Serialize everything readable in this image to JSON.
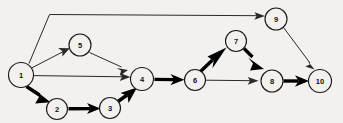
{
  "diagram": {
    "background_color": "#f2f1ef",
    "node_fill": "#f2f1ef",
    "node_stroke": "#1a1a1a",
    "edge_thin_color": "#2a2a2a",
    "edge_bold_color": "#000000",
    "nodes": [
      {
        "id": "1",
        "label": "1",
        "cx": 21,
        "cy": 75,
        "r": 12.5
      },
      {
        "id": "2",
        "label": "2",
        "cx": 57,
        "cy": 109,
        "r": 10.5
      },
      {
        "id": "3",
        "label": "3",
        "cx": 110,
        "cy": 108,
        "r": 10.5
      },
      {
        "id": "4",
        "label": "4",
        "cx": 142,
        "cy": 79,
        "r": 11.5
      },
      {
        "id": "5",
        "label": "5",
        "cx": 80,
        "cy": 45,
        "r": 11.0
      },
      {
        "id": "6",
        "label": "6",
        "cx": 195,
        "cy": 80,
        "r": 10.5
      },
      {
        "id": "7",
        "label": "7",
        "cx": 236,
        "cy": 41,
        "r": 10.5
      },
      {
        "id": "8",
        "label": "8",
        "cx": 272,
        "cy": 81,
        "r": 11.0
      },
      {
        "id": "9",
        "label": "9",
        "cx": 276,
        "cy": 19,
        "r": 11.0
      },
      {
        "id": "10",
        "label": "10",
        "cx": 320,
        "cy": 81,
        "r": 11.5
      }
    ],
    "edges": [
      {
        "from": "1",
        "to": "9",
        "style": "thin",
        "shape": "polyline"
      },
      {
        "from": "1",
        "to": "5",
        "style": "thin",
        "shape": "line"
      },
      {
        "from": "1",
        "to": "4",
        "style": "thin",
        "shape": "line"
      },
      {
        "from": "1",
        "to": "2",
        "style": "bold",
        "shape": "line"
      },
      {
        "from": "5",
        "to": "4",
        "style": "thin",
        "shape": "line"
      },
      {
        "from": "2",
        "to": "3",
        "style": "bold",
        "shape": "line"
      },
      {
        "from": "3",
        "to": "4",
        "style": "bold",
        "shape": "line"
      },
      {
        "from": "4",
        "to": "6",
        "style": "bold",
        "shape": "line"
      },
      {
        "from": "6",
        "to": "7",
        "style": "bold",
        "shape": "line"
      },
      {
        "from": "6",
        "to": "8",
        "style": "thin",
        "shape": "line"
      },
      {
        "from": "7",
        "to": "8",
        "style": "bold",
        "shape": "line"
      },
      {
        "from": "8",
        "to": "10",
        "style": "bold",
        "shape": "line"
      },
      {
        "from": "9",
        "to": "10",
        "style": "thin",
        "shape": "line"
      }
    ]
  }
}
